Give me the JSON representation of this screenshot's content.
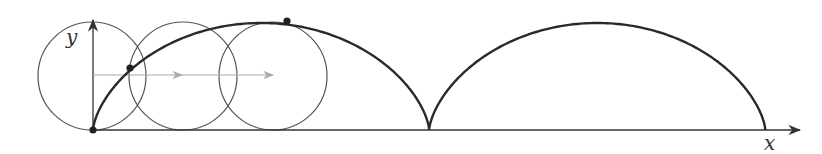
{
  "diagram": {
    "type": "cycloid",
    "labels": {
      "x_axis": "x",
      "y_axis": "y"
    },
    "colors": {
      "curve": "#2a2a2a",
      "circle": "#555555",
      "axis": "#333333",
      "motion_arrow": "#aaaaaa",
      "point": "#222222"
    },
    "radius_px": 53.5,
    "origin_px": [
      93,
      130
    ],
    "arches": 2,
    "rolling_circles": [
      {
        "center": [
          92,
          76
        ]
      },
      {
        "center": [
          183,
          76
        ]
      },
      {
        "center": [
          273,
          76
        ]
      }
    ],
    "marked_points": [
      [
        93,
        130
      ],
      [
        130,
        68
      ],
      [
        287,
        21
      ]
    ],
    "motion_arrows": [
      {
        "from": [
          93,
          75
        ],
        "to": [
          182,
          75
        ]
      },
      {
        "from": [
          182,
          75
        ],
        "to": [
          273,
          75
        ]
      }
    ]
  }
}
